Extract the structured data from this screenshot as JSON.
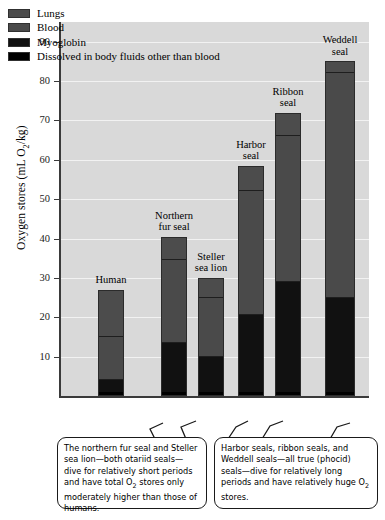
{
  "chart_data": {
    "type": "bar",
    "stacked": true,
    "title": "",
    "xlabel": "",
    "ylabel": "Oxygen stores (mL O₂/kg)",
    "ylim": [
      0,
      95
    ],
    "yticks": [
      10,
      20,
      30,
      40,
      50,
      60,
      70,
      80,
      90
    ],
    "grid": true,
    "legend_position": "top-left",
    "categories": [
      "Human",
      "Northern fur seal",
      "Steller sea lion",
      "Harbor seal",
      "Ribbon seal",
      "Weddell seal"
    ],
    "series": [
      {
        "name": "Dissolved in body fluids other than blood",
        "color": "#000000",
        "values": [
          1.0,
          1.0,
          1.0,
          1.0,
          1.0,
          1.0
        ]
      },
      {
        "name": "Myoglobin",
        "color": "#111111",
        "values": [
          3.0,
          12.5,
          9.0,
          19.5,
          28.0,
          24.0
        ]
      },
      {
        "name": "Blood",
        "color": "#4a4a4a",
        "values": [
          11.0,
          21.0,
          15.0,
          31.5,
          37.0,
          57.0
        ]
      },
      {
        "name": "Lungs",
        "color": "#4c4c4c",
        "values": [
          12.0,
          6.0,
          5.0,
          6.5,
          6.0,
          3.0
        ]
      }
    ],
    "totals": [
      27.0,
      40.5,
      30.0,
      58.5,
      72.0,
      85.0
    ]
  },
  "legend": {
    "items": [
      {
        "label": "Lungs",
        "swatch": "#4c4c4c"
      },
      {
        "label": "Blood",
        "swatch": "#4a4a4a"
      },
      {
        "label": "Myoglobin",
        "swatch": "#111111"
      },
      {
        "label": "Dissolved in body fluids other than blood",
        "swatch": "#000000"
      }
    ]
  },
  "bar_labels": [
    "Human",
    "Northern\nfur seal",
    "Steller\nsea lion",
    "Harbor\nseal",
    "Ribbon\nseal",
    "Weddell\nseal"
  ],
  "axis": {
    "y_title_part1": "Oxygen stores (mL O",
    "y_title_sub": "2",
    "y_title_part2": "/kg)",
    "tick_labels": [
      "90",
      "80",
      "70",
      "60",
      "50",
      "40",
      "30",
      "20",
      "10"
    ]
  },
  "callouts": {
    "left": {
      "line1": "The northern fur seal and Steller sea",
      "line2": "lion—both otariid seals—dive for",
      "line3": "relatively short periods and have",
      "line4_a": "total O",
      "line4_sub": "2",
      "line4_b": " stores only moderately",
      "line5": "higher than those of humans."
    },
    "right": {
      "line1": "Harbor seals, ribbon seals, and",
      "line2": "Weddell seals—all true (phocid)",
      "line3": "seals—dive for relatively long",
      "line4": "periods and have relatively huge",
      "line5_a": "O",
      "line5_sub": "2",
      "line5_b": " stores."
    }
  },
  "colors": {
    "plot_background": "#d9d9d9",
    "gridline": "#f2f2f2",
    "axis": "#3a3a3a",
    "page_background": "#ffffff"
  }
}
